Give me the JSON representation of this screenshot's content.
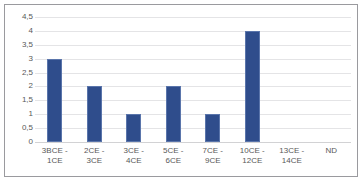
{
  "chart_data": {
    "type": "bar",
    "title": "",
    "xlabel": "",
    "ylabel": "",
    "categories": [
      "3BCE - 1CE",
      "2CE - 3CE",
      "3CE - 4CE",
      "5CE - 6CE",
      "7CE - 9CE",
      "10CE - 12CE",
      "13CE - 14CE",
      "ND"
    ],
    "values": [
      3,
      2,
      1,
      2,
      1,
      4,
      0,
      0
    ],
    "ylim": [
      0,
      4.5
    ],
    "ytick_labels": [
      "0",
      "0,5",
      "1",
      "1,5",
      "2",
      "2,5",
      "3",
      "3,5",
      "4",
      "4,5"
    ],
    "ytick_values": [
      0,
      0.5,
      1,
      1.5,
      2,
      2.5,
      3,
      3.5,
      4,
      4.5
    ],
    "grid": true,
    "legend": false,
    "bar_color": "#2f4d8c",
    "gridline_color": "#e4e4e6",
    "border_color": "#9a9a9e"
  }
}
